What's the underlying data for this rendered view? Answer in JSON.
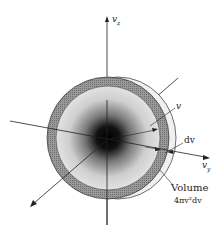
{
  "labels": {
    "vz": "v",
    "vz_sub": "z",
    "vy": "v",
    "vy_sub": "y",
    "v": "v",
    "dv": "dv",
    "volume_title": "Volume",
    "volume_formula": "4πv²dv"
  },
  "colors": {
    "background": "#ffffff",
    "shell": "#8a8a8a",
    "sphere_light": "#e4e4e4",
    "core": "#000000",
    "outer_rim": "#eeeeee"
  }
}
